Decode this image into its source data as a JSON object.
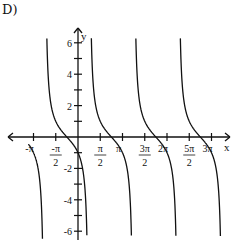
{
  "problem_label": "D)",
  "chart_data": {
    "type": "line",
    "title": "",
    "function": "y = cot(x - π/4)",
    "xlabel": "x",
    "ylabel": "y",
    "xlim": [
      -3.5,
      10.2
    ],
    "ylim": [
      -6.5,
      7
    ],
    "x_ticks": [
      {
        "value": -3.14159,
        "label": "-π"
      },
      {
        "value": -1.5708,
        "label": "-π/2"
      },
      {
        "value": 1.5708,
        "label": "π/2"
      },
      {
        "value": 3.14159,
        "label": "π"
      },
      {
        "value": 4.7124,
        "label": "3π/2"
      },
      {
        "value": 6.28318,
        "label": "2π"
      },
      {
        "value": 7.854,
        "label": "5π/2"
      },
      {
        "value": 9.42478,
        "label": "3π"
      }
    ],
    "y_ticks": [
      {
        "value": 6,
        "label": "6"
      },
      {
        "value": 5,
        "label": ""
      },
      {
        "value": 4,
        "label": "4"
      },
      {
        "value": 3,
        "label": ""
      },
      {
        "value": 2,
        "label": "2"
      },
      {
        "value": 1,
        "label": ""
      },
      {
        "value": -1,
        "label": ""
      },
      {
        "value": -2,
        "label": "-2"
      },
      {
        "value": -3,
        "label": ""
      },
      {
        "value": -4,
        "label": "-4"
      },
      {
        "value": -5,
        "label": ""
      },
      {
        "value": -6,
        "label": "-6"
      }
    ],
    "asymptotes": [
      -2.356,
      0.785,
      3.927,
      7.069,
      10.21
    ],
    "zeros": [
      -0.785,
      2.356,
      5.498,
      8.639
    ],
    "grid": false,
    "legend": null
  }
}
